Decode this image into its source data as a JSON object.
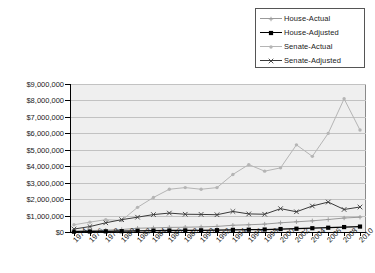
{
  "legend": {
    "position": "top-right",
    "entries": [
      {
        "label": "House-Actual",
        "color": "#9a9a9a",
        "marker": "plus-marker"
      },
      {
        "label": "House-Adjusted",
        "color": "#000000",
        "marker": "square-marker"
      },
      {
        "label": "Senate-Actual",
        "color": "#b5b5b5",
        "marker": "dot-marker"
      },
      {
        "label": "Senate-Adjusted",
        "color": "#3a3a3a",
        "marker": "x-marker"
      }
    ]
  },
  "axis": {
    "y_tick_labels": [
      "$9,000,000",
      "$8,000,000",
      "$7,000,000",
      "$6,000,000",
      "$5,000,000",
      "$4,000,000",
      "$3,000,000",
      "$2,000,000",
      "$1,000,000",
      "$0"
    ],
    "x_tick_labels": [
      "1974",
      "1976",
      "1978",
      "1980",
      "1982",
      "1984",
      "1986",
      "1988",
      "1990",
      "1992",
      "1994",
      "1996",
      "1998",
      "2000",
      "2002",
      "2004",
      "2006",
      "2008",
      "2010"
    ]
  },
  "colors": {
    "plot_background": "#efefef",
    "gridline": "#c2c2c2",
    "axis": "#000000",
    "legend_border": "#555555",
    "page_background": "#ffffff"
  },
  "chart_data": {
    "type": "line",
    "title": "",
    "xlabel": "",
    "ylabel": "",
    "ylim": [
      0,
      9000000
    ],
    "ytick_step": 1000000,
    "grid": true,
    "legend_position": "top-right",
    "x": [
      1974,
      1976,
      1978,
      1980,
      1982,
      1984,
      1986,
      1988,
      1990,
      1992,
      1994,
      1996,
      1998,
      2000,
      2002,
      2004,
      2006,
      2008,
      2010
    ],
    "series": [
      {
        "name": "House-Actual",
        "color": "#9a9a9a",
        "marker": "plus-marker",
        "values": [
          56000,
          87000,
          110000,
          150000,
          230000,
          250000,
          280000,
          290000,
          310000,
          340000,
          410000,
          440000,
          480000,
          560000,
          620000,
          680000,
          760000,
          850000,
          900000
        ]
      },
      {
        "name": "House-Adjusted",
        "color": "#000000",
        "marker": "square-marker",
        "values": [
          20000,
          30000,
          40000,
          50000,
          70000,
          80000,
          90000,
          95000,
          100000,
          110000,
          130000,
          140000,
          150000,
          180000,
          200000,
          230000,
          260000,
          300000,
          330000
        ]
      },
      {
        "name": "Senate-Actual",
        "color": "#b5b5b5",
        "marker": "dot-marker",
        "values": [
          440000,
          600000,
          750000,
          700000,
          1500000,
          2100000,
          2600000,
          2700000,
          2600000,
          2700000,
          3500000,
          4100000,
          3700000,
          3900000,
          5300000,
          4600000,
          6000000,
          8100000,
          6200000
        ]
      },
      {
        "name": "Senate-Adjusted",
        "color": "#3a3a3a",
        "marker": "x-marker",
        "values": [
          180000,
          330000,
          560000,
          750000,
          900000,
          1060000,
          1150000,
          1080000,
          1070000,
          1050000,
          1250000,
          1100000,
          1080000,
          1420000,
          1230000,
          1580000,
          1820000,
          1370000,
          1520000
        ]
      }
    ]
  }
}
